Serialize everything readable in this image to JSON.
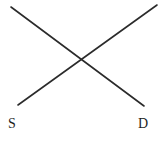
{
  "figure": {
    "type": "line-diagram",
    "background_color": "#ffffff",
    "width": 163,
    "height": 142
  },
  "chart_data": {
    "type": "line",
    "title": "",
    "xlabel": "",
    "ylabel": "",
    "grid": false,
    "legend_position": "none",
    "axis_visible": false,
    "xlim": [
      0,
      163
    ],
    "ylim": [
      142,
      0
    ],
    "series": [
      {
        "name": "S",
        "label": "S",
        "color": "#2b2b2b",
        "stroke_width": 1.6,
        "direction": "downward-sloping",
        "points": [
          {
            "x": 11,
            "y": 7
          },
          {
            "x": 144,
            "y": 106
          }
        ]
      },
      {
        "name": "D",
        "label": "D",
        "color": "#2b2b2b",
        "stroke_width": 1.6,
        "direction": "upward-sloping",
        "points": [
          {
            "x": 18,
            "y": 105
          },
          {
            "x": 157,
            "y": 5
          }
        ]
      }
    ],
    "intersection": {
      "x": 85,
      "y": 62
    },
    "annotations": [
      {
        "name": "supply-label",
        "text": "S",
        "x": 8,
        "y": 117
      },
      {
        "name": "demand-label",
        "text": "D",
        "x": 138,
        "y": 117
      }
    ]
  },
  "labels": {
    "supply": "S",
    "demand": "D"
  },
  "colors": {
    "line": "#2b2b2b",
    "text": "#1f1f1f",
    "background": "#ffffff"
  }
}
